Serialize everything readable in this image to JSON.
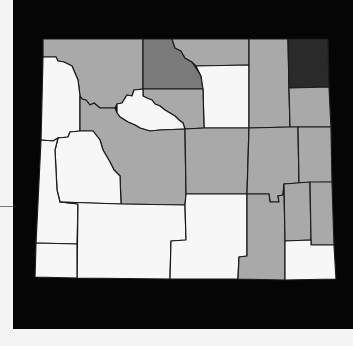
{
  "map": {
    "title": "",
    "region": "Wyoming counties",
    "legend": [],
    "colors": {
      "frame": "#050505",
      "background": "#f4f4f4",
      "white": "#f7f7f7",
      "light_gray": "#a9a9a9",
      "mid_gray": "#7a7a7a",
      "dark_gray": "#2a2a2a",
      "border": "#1a1a1a"
    },
    "counties": [
      {
        "name": "Park",
        "shade": "light_gray"
      },
      {
        "name": "Teton",
        "shade": "white"
      },
      {
        "name": "Big Horn",
        "shade": "mid_gray"
      },
      {
        "name": "Sheridan",
        "shade": "light_gray"
      },
      {
        "name": "Johnson",
        "shade": "white"
      },
      {
        "name": "Campbell",
        "shade": "light_gray"
      },
      {
        "name": "Crook",
        "shade": "dark_gray"
      },
      {
        "name": "Weston",
        "shade": "light_gray"
      },
      {
        "name": "Washakie",
        "shade": "light_gray"
      },
      {
        "name": "Hot Springs",
        "shade": "white"
      },
      {
        "name": "Fremont",
        "shade": "light_gray"
      },
      {
        "name": "Sublette",
        "shade": "white"
      },
      {
        "name": "Lincoln",
        "shade": "white"
      },
      {
        "name": "Natrona",
        "shade": "light_gray"
      },
      {
        "name": "Converse",
        "shade": "light_gray"
      },
      {
        "name": "Niobrara",
        "shade": "light_gray"
      },
      {
        "name": "Sweetwater",
        "shade": "white"
      },
      {
        "name": "Uinta",
        "shade": "white"
      },
      {
        "name": "Carbon",
        "shade": "white"
      },
      {
        "name": "Albany",
        "shade": "light_gray"
      },
      {
        "name": "Platte",
        "shade": "light_gray"
      },
      {
        "name": "Goshen",
        "shade": "light_gray"
      },
      {
        "name": "Laramie",
        "shade": "white"
      }
    ]
  }
}
